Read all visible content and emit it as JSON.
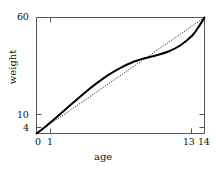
{
  "chart_data": {
    "type": "line",
    "title": "",
    "xlabel": "age",
    "ylabel": "weight",
    "xlim": [
      0,
      14
    ],
    "ylim": [
      4,
      60
    ],
    "grid": false,
    "legend": null,
    "xticks": [
      {
        "value": 0,
        "label": "0"
      },
      {
        "value": 1,
        "label": "1"
      },
      {
        "value": 13,
        "label": "13"
      },
      {
        "value": 14,
        "label": "14"
      }
    ],
    "yticks": [
      {
        "value": 4,
        "label": "4"
      },
      {
        "value": 10,
        "label": "10"
      },
      {
        "value": 60,
        "label": "60"
      }
    ],
    "series": [
      {
        "name": "growth-curve",
        "style": "solid",
        "color": "#000000",
        "width": 2.0,
        "x": [
          0,
          0.5,
          1,
          1.5,
          2,
          3,
          4,
          5,
          6,
          7,
          8,
          9,
          10,
          11,
          12,
          13,
          13.5,
          14
        ],
        "y": [
          4,
          6.2,
          8.6,
          11.0,
          13.5,
          18.6,
          23.6,
          28.2,
          32.3,
          35.7,
          38.4,
          40.3,
          41.8,
          43.6,
          46.6,
          51.4,
          55.4,
          60
        ]
      },
      {
        "name": "reference-line",
        "style": "dotted",
        "color": "#000000",
        "width": 1.0,
        "x": [
          0,
          14
        ],
        "y": [
          4,
          60
        ]
      }
    ]
  },
  "axes": {
    "frame_color": "#555555",
    "tick_color": "#555555"
  }
}
